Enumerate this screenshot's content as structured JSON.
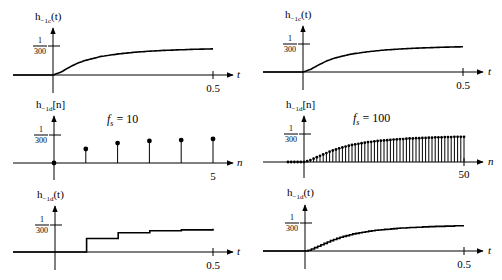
{
  "figure": {
    "panels": [
      {
        "id": "top-left",
        "ylabel_main": "h",
        "ylabel_sub": "−1c",
        "ylabel_arg": "(t)",
        "xlabel": "t",
        "ytick_num": "1",
        "ytick_den": "300",
        "xtick": "0.5",
        "annotation": ""
      },
      {
        "id": "top-right",
        "ylabel_main": "h",
        "ylabel_sub": "−1c",
        "ylabel_arg": "(t)",
        "xlabel": "t",
        "ytick_num": "1",
        "ytick_den": "300",
        "xtick": "0.5",
        "annotation": ""
      },
      {
        "id": "middle-left",
        "ylabel_main": "h",
        "ylabel_sub": "−1d",
        "ylabel_arg": "[n]",
        "xlabel": "n",
        "ytick_num": "1",
        "ytick_den": "300",
        "xtick": "5",
        "annotation_f": "f",
        "annotation_sub": "s",
        "annotation_val": " = 10"
      },
      {
        "id": "middle-right",
        "ylabel_main": "h",
        "ylabel_sub": "−1d",
        "ylabel_arg": "[n]",
        "xlabel": "n",
        "ytick_num": "1",
        "ytick_den": "300",
        "xtick": "50",
        "annotation_f": "f",
        "annotation_sub": "s",
        "annotation_val": " = 100"
      },
      {
        "id": "bottom-left",
        "ylabel_main": "h",
        "ylabel_sub": "−1d",
        "ylabel_arg": "(t)",
        "xlabel": "t",
        "ytick_num": "1",
        "ytick_den": "300",
        "xtick": "0.5",
        "annotation": ""
      },
      {
        "id": "bottom-right",
        "ylabel_main": "h",
        "ylabel_sub": "−1d",
        "ylabel_arg": "(t)",
        "xlabel": "t",
        "ytick_num": "1",
        "ytick_den": "300",
        "xtick": "0.5",
        "annotation": ""
      }
    ]
  },
  "chart_data": {
    "type": "line",
    "units_note": "values normalized to the 1/300 tick level",
    "continuous": {
      "t": [
        0,
        0.025,
        0.05,
        0.075,
        0.1,
        0.15,
        0.2,
        0.25,
        0.3,
        0.35,
        0.4,
        0.45,
        0.5
      ],
      "values": [
        0,
        0.1,
        0.26,
        0.4,
        0.5,
        0.64,
        0.72,
        0.78,
        0.82,
        0.85,
        0.87,
        0.89,
        0.9
      ]
    },
    "fs10": {
      "n": [
        0,
        1,
        2,
        3,
        4,
        5
      ],
      "values": [
        0,
        0.5,
        0.71,
        0.79,
        0.82,
        0.86
      ]
    },
    "fs100": {
      "n_start": -5,
      "n_end": 50,
      "values": [
        0,
        0,
        0,
        0,
        0,
        0,
        0.03,
        0.07,
        0.12,
        0.17,
        0.22,
        0.27,
        0.32,
        0.37,
        0.41,
        0.45,
        0.49,
        0.52,
        0.55,
        0.58,
        0.61,
        0.63,
        0.65,
        0.67,
        0.69,
        0.71,
        0.72,
        0.74,
        0.75,
        0.76,
        0.77,
        0.78,
        0.79,
        0.8,
        0.81,
        0.82,
        0.82,
        0.83,
        0.84,
        0.84,
        0.85,
        0.85,
        0.86,
        0.86,
        0.87,
        0.87,
        0.88,
        0.88,
        0.88,
        0.89,
        0.89,
        0.89,
        0.9,
        0.9,
        0.9,
        0.9
      ]
    }
  }
}
